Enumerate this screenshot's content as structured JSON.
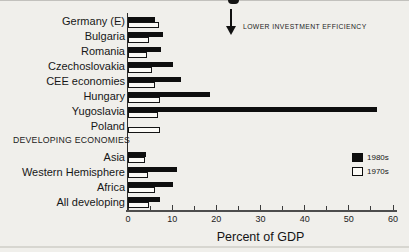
{
  "annotation": {
    "arrow_direction": "down",
    "label": "LOWER INVESTMENT EFFICIENCY"
  },
  "colors": {
    "bar_1980s": "#0e0e0e",
    "bar_1970s_fill": "#fbfaf6",
    "bar_1970s_border": "#141414",
    "background": "#f0efeb"
  },
  "chart_data": {
    "type": "bar",
    "orientation": "horizontal",
    "title": "",
    "xlabel": "Percent of GDP",
    "ylabel": "",
    "xlim": [
      0,
      60
    ],
    "x_ticks": [
      0,
      10,
      20,
      30,
      40,
      50,
      60
    ],
    "minor_tick_step": 5,
    "grid": false,
    "legend_position": "right",
    "annotation": "LOWER INVESTMENT EFFICIENCY",
    "legend": [
      {
        "name": "1980s",
        "color": "#0e0e0e",
        "style": "filled"
      },
      {
        "name": "1970s",
        "color": "#fbfaf6",
        "style": "outlined"
      }
    ],
    "groups": [
      {
        "name": "cee-economies",
        "header": "",
        "rows": [
          {
            "label": "Germany (E)",
            "v1980s": 6.2,
            "v1970s": 7.0
          },
          {
            "label": "Bulgaria",
            "v1980s": 8.0,
            "v1970s": 4.8
          },
          {
            "label": "Romania",
            "v1980s": 7.5,
            "v1970s": 4.3
          },
          {
            "label": "Czechoslovakia",
            "v1980s": 10.3,
            "v1970s": 5.5
          },
          {
            "label": "CEE economies",
            "v1980s": 11.9,
            "v1970s": 6.2
          },
          {
            "label": "Hungary",
            "v1980s": 18.5,
            "v1970s": 7.2
          },
          {
            "label": "Yugoslavia",
            "v1980s": 56.3,
            "v1970s": 6.8
          },
          {
            "label": "Poland",
            "v1980s": null,
            "v1970s": 7.2
          }
        ]
      },
      {
        "name": "developing-economies",
        "header": "DEVELOPING ECONOMIES",
        "rows": [
          {
            "label": "Asia",
            "v1980s": 4.1,
            "v1970s": 3.8
          },
          {
            "label": "Western Hemisphere",
            "v1980s": 11.0,
            "v1970s": 4.6
          },
          {
            "label": "Africa",
            "v1980s": 10.3,
            "v1970s": 6.0
          },
          {
            "label": "All developing",
            "v1980s": 7.2,
            "v1970s": 4.8
          }
        ]
      }
    ]
  }
}
